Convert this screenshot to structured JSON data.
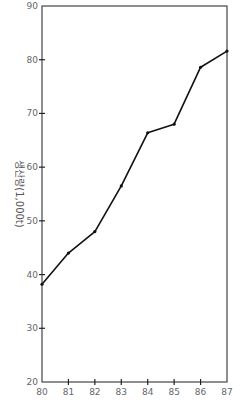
{
  "chart_data": {
    "type": "line",
    "title": "",
    "xlabel": "",
    "ylabel": "생산량(1,000t)",
    "x": [
      80,
      81,
      82,
      83,
      84,
      85,
      86,
      87
    ],
    "series": [
      {
        "name": "생산량",
        "values": [
          38.2,
          44.0,
          48.0,
          56.5,
          66.4,
          68.0,
          78.6,
          81.6
        ]
      }
    ],
    "xlim": [
      80,
      87
    ],
    "ylim": [
      20,
      90
    ],
    "x_ticks": [
      "80",
      "81",
      "82",
      "83",
      "84",
      "85",
      "86",
      "87"
    ],
    "y_ticks": [
      "20",
      "30",
      "40",
      "50",
      "60",
      "70",
      "80",
      "90"
    ],
    "grid": false,
    "legend": "none",
    "colors": {
      "line": "#111111",
      "axis": "#444444",
      "text": "#666666"
    }
  }
}
